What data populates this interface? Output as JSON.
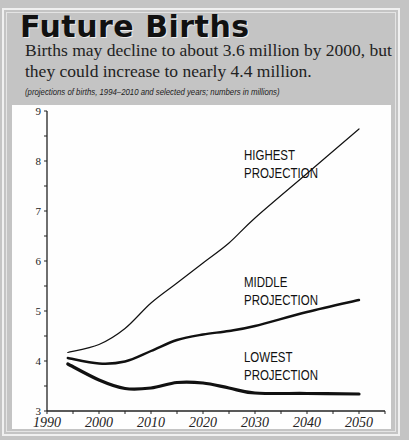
{
  "title": "Future Births",
  "subtitle": "Births may decline to about 3.6 million by 2000, but they could increase to nearly 4.4 million.",
  "note": "(projections of births, 1994–2010 and selected years; numbers in millions)",
  "chart_data": {
    "type": "line",
    "title": "Future Births",
    "subtitle": "Births may decline to about 3.6 million by 2000, but they could increase to nearly 4.4 million.",
    "xlabel": "",
    "ylabel": "",
    "xlim": [
      1990,
      2055
    ],
    "ylim": [
      3,
      9
    ],
    "x_ticks": [
      1990,
      2000,
      2010,
      2020,
      2030,
      2040,
      2050
    ],
    "y_ticks": [
      3,
      4,
      5,
      6,
      7,
      8,
      9
    ],
    "grid": false,
    "x": [
      1994,
      2000,
      2005,
      2010,
      2015,
      2020,
      2025,
      2030,
      2040,
      2050
    ],
    "series": [
      {
        "name": "HIGHEST PROJECTION",
        "label_lines": [
          "HIGHEST",
          "PROJECTION"
        ],
        "stroke": 1.2,
        "values": [
          4.17,
          4.33,
          4.65,
          5.16,
          5.56,
          5.96,
          6.36,
          6.86,
          7.75,
          8.64
        ]
      },
      {
        "name": "MIDDLE PROJECTION",
        "label_lines": [
          "MIDDLE",
          "PROJECTION"
        ],
        "stroke": 2.4,
        "values": [
          4.06,
          3.95,
          3.99,
          4.2,
          4.42,
          4.53,
          4.6,
          4.7,
          4.98,
          5.22
        ]
      },
      {
        "name": "LOWEST PROJECTION",
        "label_lines": [
          "LOWEST",
          "PROJECTION"
        ],
        "stroke": 3.2,
        "values": [
          3.94,
          3.62,
          3.45,
          3.46,
          3.57,
          3.56,
          3.46,
          3.36,
          3.35,
          3.34
        ]
      }
    ],
    "label_positions": [
      {
        "x": 244,
        "y": 160
      },
      {
        "x": 244,
        "y": 287
      },
      {
        "x": 244,
        "y": 362
      }
    ]
  }
}
